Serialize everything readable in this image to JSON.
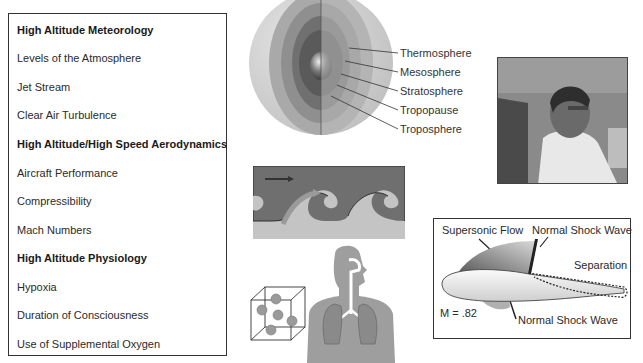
{
  "topics": {
    "items": [
      {
        "label": "High Altitude Meteorology",
        "heading": true
      },
      {
        "label": "Levels of the Atmosphere",
        "heading": false
      },
      {
        "label": "Jet Stream",
        "heading": false
      },
      {
        "label": "Clear Air Turbulence",
        "heading": false
      },
      {
        "label": "High Altitude/High Speed Aerodynamics",
        "heading": true
      },
      {
        "label": "Aircraft Performance",
        "heading": false
      },
      {
        "label": "Compressibility",
        "heading": false
      },
      {
        "label": "Mach Numbers",
        "heading": false
      },
      {
        "label": "High Altitude Physiology",
        "heading": true
      },
      {
        "label": "Hypoxia",
        "heading": false
      },
      {
        "label": "Duration of Consciousness",
        "heading": false
      },
      {
        "label": "Use of Supplemental Oxygen",
        "heading": false
      }
    ]
  },
  "atmosphere": {
    "layers": [
      "Thermosphere",
      "Mesosphere",
      "Stratosphere",
      "Tropopause",
      "Troposphere"
    ]
  },
  "airfoil": {
    "supersonic_flow": "Supersonic Flow",
    "shock_top": "Normal Shock Wave",
    "separation": "Separation",
    "mach": "M = .82",
    "shock_bottom": "Normal Shock Wave"
  },
  "colors": {
    "border": "#333333",
    "text": "#2a2a2a",
    "gray_light": "#d4d4d4",
    "gray_mid": "#a8a8a8",
    "gray_dark": "#6e6e6e"
  }
}
